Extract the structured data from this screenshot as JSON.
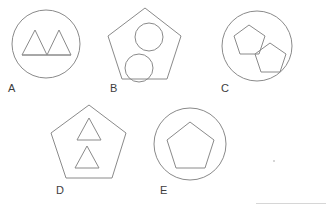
{
  "page": {
    "background_color": "#ffffff",
    "stroke_color": "#8a8a8a",
    "label_color": "#3d3d3d",
    "rule_color": "#d6d6d6",
    "width": 329,
    "height": 211
  },
  "figures": [
    {
      "id": "A",
      "label": "A",
      "outer_shape": "circle",
      "inner_shape": "triangle",
      "inner_count": 2,
      "inner_arrangement": "side-by-side sharing baseline",
      "label_x": 8,
      "label_y": 83
    },
    {
      "id": "B",
      "label": "B",
      "outer_shape": "pentagon",
      "inner_shape": "circle",
      "inner_count": 2,
      "inner_arrangement": "diagonal upper-right and lower-left",
      "label_x": 110,
      "label_y": 83
    },
    {
      "id": "C",
      "label": "C",
      "outer_shape": "circle",
      "inner_shape": "pentagon",
      "inner_count": 2,
      "inner_arrangement": "diagonal upper-left and lower-right",
      "label_x": 221,
      "label_y": 83
    },
    {
      "id": "D",
      "label": "D",
      "outer_shape": "pentagon",
      "inner_shape": "triangle",
      "inner_count": 2,
      "inner_arrangement": "stacked vertically",
      "label_x": 56,
      "label_y": 185
    },
    {
      "id": "E",
      "label": "E",
      "outer_shape": "circle",
      "inner_shape": "pentagon",
      "inner_count": 1,
      "inner_arrangement": "centered",
      "label_x": 160,
      "label_y": 185
    }
  ],
  "marks": {
    "bottom_rule": "horizontal rule",
    "speck": "dot artifact"
  }
}
